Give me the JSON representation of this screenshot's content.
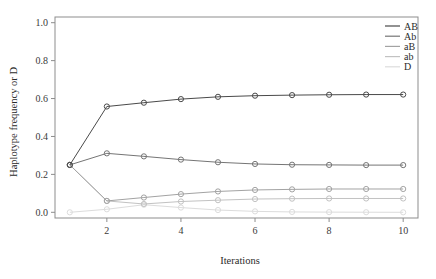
{
  "chart_data": {
    "type": "line",
    "title": "",
    "xlabel": "Iterations",
    "ylabel": "Haplotype frequency or D",
    "x": [
      1,
      2,
      3,
      4,
      5,
      6,
      7,
      8,
      9,
      10
    ],
    "xlim": [
      0.6,
      10.4
    ],
    "ylim": [
      -0.03,
      1.03
    ],
    "xticks": [
      2,
      4,
      6,
      8,
      10
    ],
    "xticklabels": [
      "2",
      "4",
      "6",
      "8",
      "10"
    ],
    "yticks": [
      0.0,
      0.2,
      0.4,
      0.6,
      0.8,
      1.0
    ],
    "yticklabels": [
      "0.0",
      "0.2",
      "0.4",
      "0.6",
      "0.8",
      "1.0"
    ],
    "grid": false,
    "legend_position": "top-right",
    "marker": "circle-open",
    "series": [
      {
        "name": "AB",
        "color": "#4a4a4a",
        "values": [
          0.25,
          0.558,
          0.578,
          0.597,
          0.609,
          0.615,
          0.618,
          0.62,
          0.621,
          0.621
        ]
      },
      {
        "name": "Ab",
        "color": "#757575",
        "values": [
          0.25,
          0.311,
          0.295,
          0.278,
          0.264,
          0.255,
          0.251,
          0.25,
          0.249,
          0.249
        ]
      },
      {
        "name": "aB",
        "color": "#a3a3a3",
        "values": [
          0.25,
          0.06,
          0.078,
          0.096,
          0.11,
          0.118,
          0.121,
          0.123,
          0.123,
          0.123
        ]
      },
      {
        "name": "ab",
        "color": "#c2c2c2",
        "values": [
          0.25,
          0.06,
          0.044,
          0.057,
          0.064,
          0.07,
          0.072,
          0.073,
          0.073,
          0.073
        ]
      },
      {
        "name": "D",
        "color": "#dcdcdc",
        "values": [
          0.0,
          0.016,
          0.04,
          0.025,
          0.012,
          0.005,
          0.002,
          0.001,
          0.0005,
          0.0
        ]
      }
    ]
  },
  "legend": {
    "items": [
      {
        "label": "AB"
      },
      {
        "label": "Ab"
      },
      {
        "label": "aB"
      },
      {
        "label": "ab"
      },
      {
        "label": "D"
      }
    ]
  },
  "colors": {
    "axis": "#8d8d8d",
    "text": "#2b2b2b",
    "background": "#ffffff"
  }
}
